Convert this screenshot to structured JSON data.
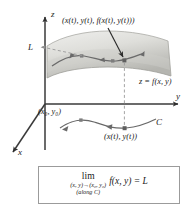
{
  "figure": {
    "background_color": "#ffffff",
    "axes": {
      "z_label": "z",
      "y_label": "y",
      "x_label": "x",
      "axis_color": "#3a3a3a"
    },
    "labels": {
      "limit_value": "L",
      "space_curve_point": "(x(t), y(t), f(x(t), y(t)))",
      "surface_equation": "z = f(x, y)",
      "domain_point": "(x₀, y₀)",
      "curve_name": "C",
      "plane_curve_point": "(x(t), y(t))"
    },
    "surface": {
      "fill_light": "#e9e9e7",
      "fill_dark": "#b9b9b5",
      "edge_color": "#8a8a86"
    },
    "curve": {
      "color": "#6a6a6a",
      "marker_color": "#7a7a7a",
      "arrow_direction": "leftward"
    },
    "dashed_color": "#9a9a9a",
    "pointer_arrow_color": "#2b2b2b"
  },
  "limit_box": {
    "border_color": "#9b9b9b",
    "operator": "lim",
    "subscript_line1": "(x, y)→(x₀, y₀)",
    "subscript_line2": "(along C)",
    "expression": "f(x, y) = L"
  }
}
